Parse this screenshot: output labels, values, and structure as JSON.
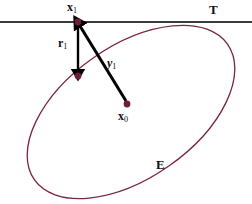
{
  "figure": {
    "background_color": "#ffffff",
    "width": 252,
    "height": 204
  },
  "colors": {
    "ellipse_stroke": "#7a2540",
    "point_fill": "#6e1f38",
    "tangent_line": "#3a3a3a",
    "arrow": "#000000",
    "label_text": "#111111"
  },
  "labels": {
    "tangent_line": "T",
    "ellipse": "E",
    "point_x1_base": "x",
    "point_x1_sub": "1",
    "point_x0_base": "x",
    "point_x0_sub": "0",
    "vector_r1_base": "r",
    "vector_r1_sub": "1",
    "vector_y1_base": "y",
    "vector_y1_sub": "1"
  },
  "geometry": {
    "tangent_line": {
      "x1": 0,
      "y1": 22,
      "x2": 252,
      "y2": 22,
      "stroke_width": 2.2
    },
    "ellipse": {
      "center_x": 131,
      "center_y": 112,
      "radius_x": 118,
      "radius_y": 66,
      "rotation_deg": -35,
      "stroke_width": 1.3
    },
    "points": [
      {
        "name": "x1",
        "x": 78,
        "y": 22,
        "r": 3.4
      },
      {
        "name": "r1-endpoint",
        "x": 78,
        "y": 76,
        "r": 3.4
      },
      {
        "name": "x0",
        "x": 127,
        "y": 104,
        "r": 3.4
      }
    ],
    "arrows": [
      {
        "name": "r1",
        "from_x": 78,
        "from_y": 24,
        "to_x": 78,
        "to_y": 70,
        "stroke_width": 2.4
      },
      {
        "name": "y1",
        "from_x": 126,
        "from_y": 101,
        "to_x": 80,
        "to_y": 26,
        "stroke_width": 3.0
      }
    ]
  }
}
